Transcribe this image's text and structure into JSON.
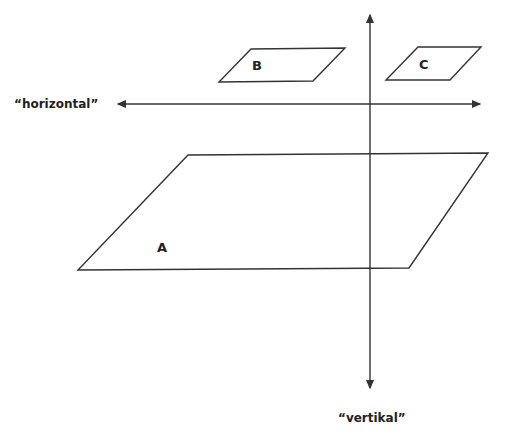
{
  "diagram": {
    "axes": {
      "horizontal_label": "“horizontal”",
      "vertical_label": "“vertikal”"
    },
    "planes": [
      {
        "label": "A",
        "points": [
          [
            188,
            155
          ],
          [
            488,
            153
          ],
          [
            409,
            268
          ],
          [
            78,
            270
          ]
        ]
      },
      {
        "label": "B",
        "points": [
          [
            251,
            49
          ],
          [
            345,
            48
          ],
          [
            313,
            81
          ],
          [
            219,
            82
          ]
        ]
      },
      {
        "label": "C",
        "points": [
          [
            418,
            47
          ],
          [
            481,
            47
          ],
          [
            450,
            80
          ],
          [
            386,
            80
          ]
        ]
      }
    ],
    "line_color": "#333333"
  }
}
